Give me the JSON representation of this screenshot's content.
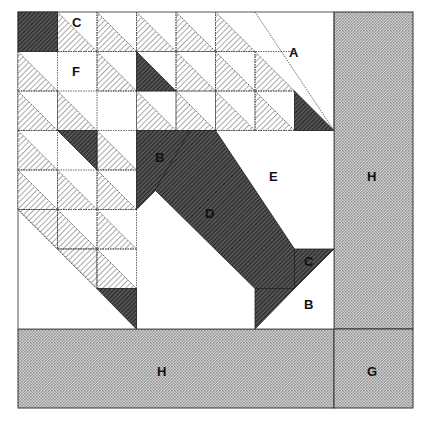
{
  "diagram": {
    "type": "quilt-block-pattern",
    "labels": {
      "A": "A",
      "B1": "B",
      "B2": "B",
      "C1": "C",
      "C2": "C",
      "D": "D",
      "E": "E",
      "F": "F",
      "H1": "H",
      "H2": "H",
      "G": "G"
    },
    "colors": {
      "background": "#ffffff",
      "line": "#333333",
      "hatch_light": "#8a8a8a",
      "hatch_dark": "#2a2a2a",
      "border_fill": "#c8c8c8"
    }
  }
}
